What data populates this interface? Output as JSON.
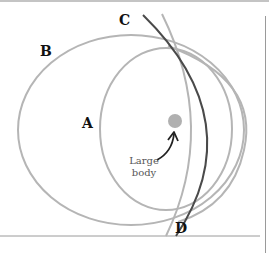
{
  "diagram": {
    "labels": {
      "A": "A",
      "B": "B",
      "C": "C",
      "D": "D"
    },
    "caption": {
      "line1": "Large",
      "line2": "body"
    },
    "colors": {
      "orbit_light": "#b5b5b5",
      "orbit_dark": "#4a4a4a",
      "body": "#b0b0b0",
      "rule": "#9a9a9a",
      "text": "#111111",
      "arrow": "#222222"
    }
  }
}
